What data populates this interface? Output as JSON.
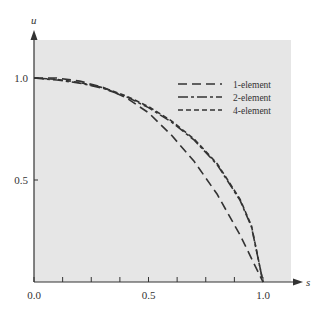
{
  "chart_data": {
    "type": "line",
    "title": "",
    "xlabel": "s",
    "ylabel": "u",
    "xlim": [
      0,
      1.15
    ],
    "ylim": [
      0,
      1.15
    ],
    "x_ticks": [
      {
        "value": 0.0,
        "label": "0.0"
      },
      {
        "value": 0.5,
        "label": "0.5"
      },
      {
        "value": 1.0,
        "label": "1.0"
      }
    ],
    "x_minor_ticks": [
      0.125,
      0.25,
      0.375,
      0.625,
      0.75,
      0.875
    ],
    "y_ticks": [
      {
        "value": 0.5,
        "label": "0.5"
      },
      {
        "value": 1.0,
        "label": "1.0"
      }
    ],
    "legend_position": "top-right",
    "grid": false,
    "series": [
      {
        "name": "1-element",
        "dash": "long-dash",
        "x": [
          0,
          0.1,
          0.2,
          0.3,
          0.4,
          0.5,
          0.6,
          0.7,
          0.8,
          0.9,
          1.0
        ],
        "y": [
          1.0,
          1.0,
          0.985,
          0.955,
          0.905,
          0.83,
          0.72,
          0.59,
          0.43,
          0.23,
          0.0
        ]
      },
      {
        "name": "2-element",
        "dash": "dash-dot",
        "x": [
          0,
          0.1,
          0.2,
          0.3,
          0.4,
          0.5,
          0.6,
          0.7,
          0.8,
          0.9,
          0.95,
          1.0
        ],
        "y": [
          1.0,
          0.99,
          0.975,
          0.95,
          0.91,
          0.855,
          0.785,
          0.695,
          0.575,
          0.4,
          0.27,
          0.0
        ]
      },
      {
        "name": "4-element",
        "dash": "short-dash",
        "x": [
          0,
          0.1,
          0.2,
          0.3,
          0.4,
          0.5,
          0.6,
          0.7,
          0.8,
          0.9,
          0.95,
          1.0
        ],
        "y": [
          1.0,
          0.993,
          0.978,
          0.953,
          0.913,
          0.86,
          0.79,
          0.7,
          0.58,
          0.405,
          0.275,
          0.0
        ]
      }
    ]
  },
  "colors": {
    "plot_background": "#e6e6e6",
    "ink": "#333333"
  }
}
